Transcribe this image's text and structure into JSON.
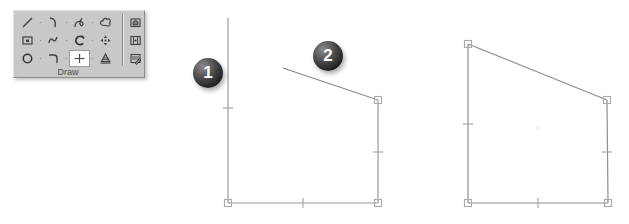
{
  "figure": {
    "width": 629,
    "height": 224,
    "background": "#ffffff"
  },
  "toolbar": {
    "title": "Draw",
    "background_color": "#c8c8c4",
    "selected_tool": "point-tool",
    "rows": [
      {
        "cells": [
          {
            "icon": "line-icon",
            "label": "Line"
          },
          {
            "icon": "arc-icon",
            "label": "Arc"
          },
          {
            "icon": "spline-icon",
            "label": "Spline"
          },
          {
            "icon": "revision-cloud-icon",
            "label": "Revision Cloud"
          }
        ]
      },
      {
        "cells": [
          {
            "icon": "rectangle-icon",
            "label": "Rectangle"
          },
          {
            "icon": "polyline-icon",
            "label": "Polyline"
          },
          {
            "icon": "arc-closed-icon",
            "label": "Arc Closed"
          },
          {
            "icon": "move-icon",
            "label": "Move"
          }
        ]
      },
      {
        "cells": [
          {
            "icon": "circle-icon",
            "label": "Circle"
          },
          {
            "icon": "fillet-icon",
            "label": "Fillet"
          },
          {
            "icon": "point-tool-icon",
            "label": "Point",
            "selected": true
          },
          {
            "icon": "gradient-icon",
            "label": "Gradient"
          }
        ]
      }
    ],
    "right_column": [
      {
        "icon": "insert-block-icon",
        "label": "Insert Block"
      },
      {
        "icon": "multiline-icon",
        "label": "Multiline"
      },
      {
        "icon": "edit-hatch-icon",
        "label": "Edit Hatch"
      }
    ],
    "separator_dot": "·"
  },
  "callouts": [
    {
      "number": "1",
      "target": "step-one-open-polyline"
    },
    {
      "number": "2",
      "target": "step-two-new-line-segment"
    }
  ],
  "drawings": {
    "step_one": {
      "name": "open-polyline-with-grips",
      "line_color": "#9a9a9a",
      "grip_color": "#b4b4b4",
      "vertices": [
        {
          "x": 8,
          "y": 18,
          "grip": false
        },
        {
          "x": 8,
          "y": 203,
          "grip": true
        },
        {
          "x": 158,
          "y": 203,
          "grip": true
        },
        {
          "x": 158,
          "y": 100,
          "grip": true
        }
      ],
      "new_segment": {
        "x1": 63,
        "y1": 68,
        "x2": 158,
        "y2": 100
      },
      "midpoint_ticks": [
        {
          "x": 8,
          "y": 108,
          "orientation": "horizontal"
        },
        {
          "x": 83,
          "y": 203,
          "orientation": "vertical"
        },
        {
          "x": 158,
          "y": 152,
          "orientation": "horizontal"
        }
      ]
    },
    "step_two": {
      "name": "closed-quadrilateral-with-grips",
      "line_color": "#8f8f8f",
      "grip_color": "#b4b4b4",
      "vertices": [
        {
          "x": 18,
          "y": 44,
          "grip": true
        },
        {
          "x": 18,
          "y": 203,
          "grip": true
        },
        {
          "x": 158,
          "y": 203,
          "grip": true
        },
        {
          "x": 157,
          "y": 100,
          "grip": true
        }
      ],
      "midpoint_ticks": [
        {
          "x": 18,
          "y": 124,
          "orientation": "horizontal"
        },
        {
          "x": 88,
          "y": 203,
          "orientation": "vertical"
        },
        {
          "x": 157,
          "y": 152,
          "orientation": "horizontal"
        }
      ],
      "center_marker": {
        "x": 88,
        "y": 128
      }
    }
  }
}
